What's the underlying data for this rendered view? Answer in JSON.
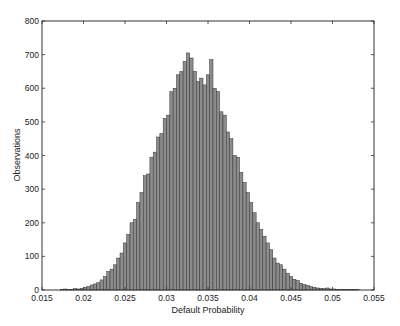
{
  "chart_data": {
    "type": "bar",
    "subtype": "histogram",
    "title": "",
    "xlabel": "Default Probability",
    "ylabel": "Observations",
    "xlim": [
      0.015,
      0.055
    ],
    "ylim": [
      0,
      800
    ],
    "xticks": [
      0.015,
      0.02,
      0.025,
      0.03,
      0.035,
      0.04,
      0.045,
      0.05,
      0.055
    ],
    "xtick_labels": [
      "0.015",
      "0.02",
      "0.025",
      "0.03",
      "0.035",
      "0.04",
      "0.045",
      "0.05",
      "0.055"
    ],
    "yticks": [
      0,
      100,
      200,
      300,
      400,
      500,
      600,
      700,
      800
    ],
    "ytick_labels": [
      "0",
      "100",
      "200",
      "300",
      "400",
      "500",
      "600",
      "700",
      "800"
    ],
    "grid": false,
    "legend": null,
    "bar_color": "#8c8c8c",
    "bar_edge_color": "#333333",
    "bin_width": 0.0004,
    "bin_centers": [
      0.0174,
      0.0178,
      0.0182,
      0.0186,
      0.019,
      0.0194,
      0.0198,
      0.0202,
      0.0206,
      0.021,
      0.0214,
      0.0218,
      0.0222,
      0.0226,
      0.023,
      0.0234,
      0.0238,
      0.0242,
      0.0246,
      0.025,
      0.0254,
      0.0258,
      0.0262,
      0.0266,
      0.027,
      0.0274,
      0.0278,
      0.0282,
      0.0286,
      0.029,
      0.0294,
      0.0298,
      0.0302,
      0.0306,
      0.031,
      0.0314,
      0.0318,
      0.0322,
      0.0326,
      0.033,
      0.0334,
      0.0338,
      0.0342,
      0.0346,
      0.035,
      0.0354,
      0.0358,
      0.0362,
      0.0366,
      0.037,
      0.0374,
      0.0378,
      0.0382,
      0.0386,
      0.039,
      0.0394,
      0.0398,
      0.0402,
      0.0406,
      0.041,
      0.0414,
      0.0418,
      0.0422,
      0.0426,
      0.043,
      0.0434,
      0.0438,
      0.0442,
      0.0446,
      0.045,
      0.0454,
      0.0458,
      0.0462,
      0.0466,
      0.047,
      0.0474,
      0.0478,
      0.0482,
      0.0486,
      0.049,
      0.0494,
      0.0498,
      0.0502,
      0.0506,
      0.051,
      0.0514,
      0.0518,
      0.0522,
      0.0526,
      0.053
    ],
    "values": [
      2,
      3,
      1,
      2,
      4,
      3,
      5,
      8,
      10,
      15,
      18,
      22,
      30,
      40,
      55,
      62,
      75,
      95,
      110,
      140,
      165,
      200,
      210,
      260,
      290,
      340,
      345,
      395,
      410,
      455,
      465,
      510,
      520,
      590,
      600,
      640,
      650,
      680,
      705,
      690,
      650,
      620,
      630,
      610,
      640,
      685,
      600,
      590,
      530,
      520,
      470,
      450,
      400,
      395,
      350,
      320,
      290,
      260,
      230,
      200,
      180,
      160,
      140,
      120,
      95,
      80,
      75,
      62,
      50,
      40,
      32,
      28,
      20,
      16,
      14,
      10,
      8,
      6,
      5,
      4,
      6,
      3,
      3,
      2,
      2,
      1,
      2,
      2,
      1,
      1
    ]
  }
}
